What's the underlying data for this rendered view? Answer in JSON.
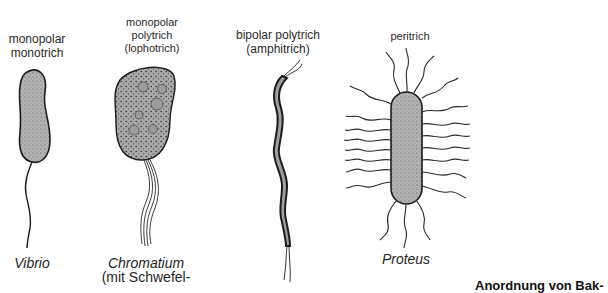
{
  "figure": {
    "caption": "Anordnung von Bak-",
    "types": [
      {
        "id": "monotrich",
        "label_lines": [
          "monopolar",
          "monotrich"
        ],
        "example": "Vibrio",
        "example_note": ""
      },
      {
        "id": "lophotrich",
        "label_lines": [
          "monopolar",
          "polytrich",
          "(lophotrich)"
        ],
        "example": "Chromatium",
        "example_note": "(mit Schwefel-"
      },
      {
        "id": "amphitrich",
        "label_lines": [
          "bipolar polytrich",
          "(amphitrich)"
        ],
        "example": "",
        "example_note": ""
      },
      {
        "id": "peritrich",
        "label_lines": [
          "peritrich"
        ],
        "example": "Proteus",
        "example_note": ""
      }
    ]
  },
  "colors": {
    "cell_fill": "#a9a9a9",
    "outline": "#1c1c1c",
    "background": "#ffffff"
  }
}
